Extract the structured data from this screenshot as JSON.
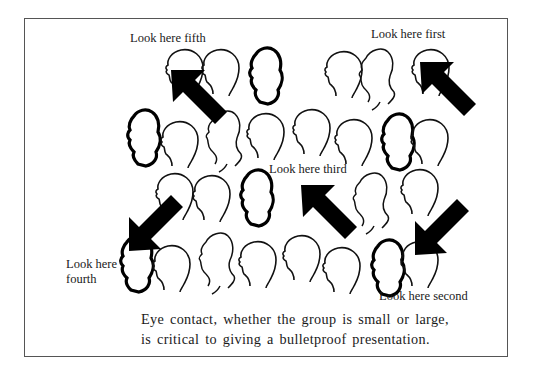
{
  "figure": {
    "labels": {
      "first": "Look here first",
      "second": "Look here second",
      "third": "Look here third",
      "fourth_line1": "Look here",
      "fourth_line2": "fourth",
      "fifth": "Look here fifth"
    },
    "caption": {
      "line1": "Eye contact, whether the group is small or large,",
      "line2": "is critical to giving a bulletproof presentation."
    },
    "arrow_count": 5,
    "arrow_color": "#000000",
    "outline_color": "#111111",
    "frame_color": "#555555"
  }
}
